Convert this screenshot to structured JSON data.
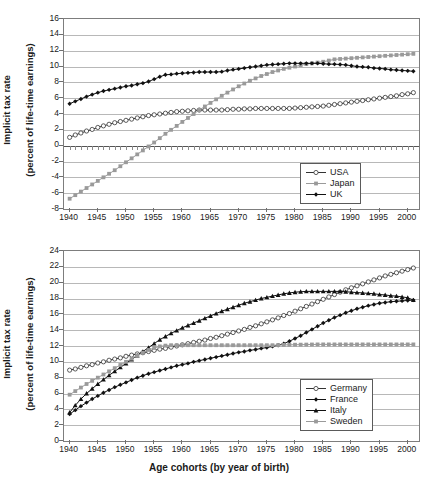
{
  "figure": {
    "xlabel": "Age cohorts (by year of birth)",
    "ylabel_line1": "Implicit tax rate",
    "ylabel_line2": "(percent of life-time earnings)"
  },
  "chart_data": [
    {
      "id": "top",
      "type": "line",
      "title": "",
      "xlabel": "",
      "ylabel": "Implicit tax rate (percent of life-time earnings)",
      "xlim": [
        1939,
        2002
      ],
      "ylim": [
        -8,
        16
      ],
      "yticks": [
        -8,
        -6,
        -4,
        -2,
        0,
        2,
        4,
        6,
        8,
        10,
        12,
        14,
        16
      ],
      "xticks": [
        1940,
        1945,
        1950,
        1955,
        1960,
        1965,
        1970,
        1975,
        1980,
        1985,
        1990,
        1995,
        2000
      ],
      "grid": true,
      "legend_position": "lower-right",
      "x": [
        1940,
        1941,
        1942,
        1943,
        1944,
        1945,
        1946,
        1947,
        1948,
        1949,
        1950,
        1951,
        1952,
        1953,
        1954,
        1955,
        1956,
        1957,
        1958,
        1959,
        1960,
        1961,
        1962,
        1963,
        1964,
        1965,
        1966,
        1967,
        1968,
        1969,
        1970,
        1971,
        1972,
        1973,
        1974,
        1975,
        1976,
        1977,
        1978,
        1979,
        1980,
        1981,
        1982,
        1983,
        1984,
        1985,
        1986,
        1987,
        1988,
        1989,
        1990,
        1991,
        1992,
        1993,
        1994,
        1995,
        1996,
        1997,
        1998,
        1999,
        2000,
        2001
      ],
      "series": [
        {
          "name": "USA",
          "marker": "open-circle",
          "color": "#333333",
          "values": [
            1.05,
            1.35,
            1.6,
            1.85,
            2.05,
            2.3,
            2.5,
            2.7,
            2.9,
            3.05,
            3.2,
            3.35,
            3.5,
            3.65,
            3.8,
            3.9,
            4.0,
            4.1,
            4.2,
            4.3,
            4.35,
            4.4,
            4.45,
            4.5,
            4.5,
            4.5,
            4.5,
            4.5,
            4.55,
            4.6,
            4.6,
            4.65,
            4.65,
            4.7,
            4.7,
            4.7,
            4.7,
            4.7,
            4.7,
            4.7,
            4.75,
            4.8,
            4.85,
            4.9,
            4.95,
            5.0,
            5.1,
            5.2,
            5.3,
            5.4,
            5.5,
            5.6,
            5.7,
            5.8,
            5.9,
            6.0,
            6.1,
            6.2,
            6.3,
            6.45,
            6.55,
            6.7
          ]
        },
        {
          "name": "Japan",
          "marker": "gray-square",
          "color": "#9a9a9a",
          "values": [
            -6.7,
            -6.25,
            -5.8,
            -5.35,
            -4.9,
            -4.45,
            -4.0,
            -3.55,
            -3.1,
            -2.6,
            -2.1,
            -1.6,
            -1.1,
            -0.6,
            -0.1,
            0.4,
            0.95,
            1.5,
            2.0,
            2.5,
            3.0,
            3.5,
            4.0,
            4.5,
            4.95,
            5.4,
            5.85,
            6.3,
            6.7,
            7.1,
            7.5,
            7.85,
            8.2,
            8.5,
            8.8,
            9.05,
            9.3,
            9.5,
            9.7,
            9.85,
            10.0,
            10.15,
            10.3,
            10.4,
            10.5,
            10.6,
            10.75,
            10.9,
            10.95,
            11.0,
            11.05,
            11.1,
            11.15,
            11.2,
            11.25,
            11.3,
            11.35,
            11.4,
            11.45,
            11.5,
            11.55,
            11.6
          ]
        },
        {
          "name": "UK",
          "marker": "filled-diamond",
          "color": "#111111",
          "values": [
            5.3,
            5.6,
            5.9,
            6.2,
            6.45,
            6.7,
            6.9,
            7.05,
            7.2,
            7.35,
            7.5,
            7.6,
            7.75,
            7.9,
            8.1,
            8.4,
            8.7,
            8.95,
            9.0,
            9.1,
            9.15,
            9.2,
            9.25,
            9.3,
            9.3,
            9.3,
            9.3,
            9.35,
            9.5,
            9.6,
            9.7,
            9.8,
            9.9,
            10.0,
            10.1,
            10.2,
            10.25,
            10.3,
            10.35,
            10.4,
            10.4,
            10.4,
            10.4,
            10.4,
            10.4,
            10.35,
            10.3,
            10.3,
            10.25,
            10.2,
            10.1,
            10.0,
            9.95,
            9.9,
            9.8,
            9.75,
            9.7,
            9.6,
            9.55,
            9.5,
            9.45,
            9.4
          ]
        }
      ]
    },
    {
      "id": "bottom",
      "type": "line",
      "title": "",
      "xlabel": "Age cohorts (by year of birth)",
      "ylabel": "Implicit tax rate (percent of life-time earnings)",
      "xlim": [
        1939,
        2002
      ],
      "ylim": [
        0,
        24
      ],
      "yticks": [
        0,
        2,
        4,
        6,
        8,
        10,
        12,
        14,
        16,
        18,
        20,
        22,
        24
      ],
      "xticks": [
        1940,
        1945,
        1950,
        1955,
        1960,
        1965,
        1970,
        1975,
        1980,
        1985,
        1990,
        1995,
        2000
      ],
      "grid": true,
      "legend_position": "lower-right",
      "x": [
        1940,
        1941,
        1942,
        1943,
        1944,
        1945,
        1946,
        1947,
        1948,
        1949,
        1950,
        1951,
        1952,
        1953,
        1954,
        1955,
        1956,
        1957,
        1958,
        1959,
        1960,
        1961,
        1962,
        1963,
        1964,
        1965,
        1966,
        1967,
        1968,
        1969,
        1970,
        1971,
        1972,
        1973,
        1974,
        1975,
        1976,
        1977,
        1978,
        1979,
        1980,
        1981,
        1982,
        1983,
        1984,
        1985,
        1986,
        1987,
        1988,
        1989,
        1990,
        1991,
        1992,
        1993,
        1994,
        1995,
        1996,
        1997,
        1998,
        1999,
        2000,
        2001
      ],
      "series": [
        {
          "name": "Germany",
          "marker": "open-circle",
          "color": "#333333",
          "values": [
            8.95,
            9.1,
            9.3,
            9.5,
            9.65,
            9.85,
            10.0,
            10.2,
            10.35,
            10.5,
            10.7,
            10.85,
            11.0,
            11.15,
            11.3,
            11.45,
            11.6,
            11.7,
            11.85,
            12.0,
            12.15,
            12.3,
            12.45,
            12.6,
            12.75,
            12.95,
            13.1,
            13.3,
            13.5,
            13.7,
            13.9,
            14.1,
            14.35,
            14.55,
            14.8,
            15.05,
            15.3,
            15.55,
            15.85,
            16.1,
            16.4,
            16.7,
            17.0,
            17.3,
            17.6,
            17.9,
            18.2,
            18.5,
            18.8,
            19.1,
            19.35,
            19.6,
            19.85,
            20.1,
            20.35,
            20.6,
            20.85,
            21.05,
            21.25,
            21.45,
            21.65,
            21.85
          ]
        },
        {
          "name": "France",
          "marker": "filled-diamond",
          "color": "#111111",
          "values": [
            3.4,
            3.9,
            4.4,
            4.85,
            5.3,
            5.7,
            6.1,
            6.45,
            6.8,
            7.1,
            7.4,
            7.7,
            8.0,
            8.25,
            8.5,
            8.7,
            8.9,
            9.1,
            9.3,
            9.5,
            9.65,
            9.8,
            10.0,
            10.15,
            10.3,
            10.45,
            10.6,
            10.75,
            10.9,
            11.05,
            11.2,
            11.3,
            11.45,
            11.55,
            11.7,
            11.8,
            11.95,
            12.1,
            12.3,
            12.6,
            12.95,
            13.3,
            13.7,
            14.1,
            14.5,
            14.9,
            15.25,
            15.6,
            15.9,
            16.2,
            16.45,
            16.7,
            16.9,
            17.1,
            17.25,
            17.4,
            17.5,
            17.6,
            17.65,
            17.7,
            17.75,
            17.8
          ]
        },
        {
          "name": "Italy",
          "marker": "filled-triangle",
          "color": "#111111",
          "values": [
            3.6,
            4.5,
            5.3,
            6.0,
            6.6,
            7.2,
            7.75,
            8.3,
            8.8,
            9.3,
            9.8,
            10.3,
            10.8,
            11.3,
            11.8,
            12.3,
            12.8,
            13.2,
            13.6,
            13.95,
            14.3,
            14.6,
            14.9,
            15.2,
            15.5,
            15.8,
            16.1,
            16.4,
            16.65,
            16.9,
            17.15,
            17.4,
            17.6,
            17.8,
            18.0,
            18.15,
            18.3,
            18.45,
            18.6,
            18.7,
            18.8,
            18.85,
            18.9,
            18.9,
            18.9,
            18.9,
            18.9,
            18.9,
            18.9,
            18.85,
            18.8,
            18.75,
            18.7,
            18.65,
            18.6,
            18.5,
            18.45,
            18.35,
            18.3,
            18.2,
            18.1,
            17.8
          ]
        },
        {
          "name": "Sweden",
          "marker": "gray-square",
          "color": "#9a9a9a",
          "values": [
            5.85,
            6.3,
            6.75,
            7.2,
            7.6,
            8.0,
            8.4,
            8.8,
            9.2,
            9.6,
            10.0,
            10.4,
            10.8,
            11.15,
            11.5,
            11.75,
            11.95,
            12.05,
            12.1,
            12.1,
            12.1,
            12.1,
            12.1,
            12.1,
            12.1,
            12.1,
            12.1,
            12.1,
            12.1,
            12.1,
            12.1,
            12.1,
            12.1,
            12.1,
            12.1,
            12.1,
            12.1,
            12.12,
            12.14,
            12.15,
            12.16,
            12.17,
            12.18,
            12.19,
            12.2,
            12.2,
            12.2,
            12.2,
            12.2,
            12.2,
            12.2,
            12.2,
            12.2,
            12.2,
            12.2,
            12.2,
            12.2,
            12.2,
            12.2,
            12.2,
            12.2,
            12.2
          ]
        }
      ]
    }
  ]
}
